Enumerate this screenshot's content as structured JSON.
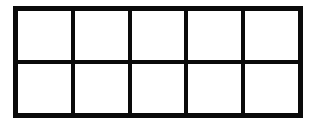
{
  "grid": {
    "rows": 2,
    "columns": 5,
    "line_color": "#0a0a0a",
    "cell_color": "#ffffff",
    "cells": [
      "",
      "",
      "",
      "",
      "",
      "",
      "",
      "",
      "",
      ""
    ]
  }
}
